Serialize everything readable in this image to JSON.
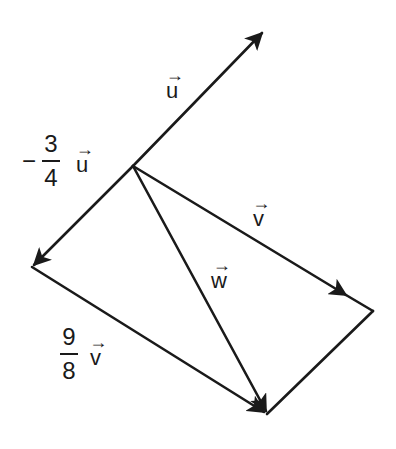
{
  "diagram": {
    "stroke_color": "#1a1a1a",
    "background": "#ffffff",
    "points": {
      "origin": [
        133,
        166
      ],
      "u_tip": [
        264,
        31
      ],
      "neg_three_quarter_u_tip": [
        32,
        267
      ],
      "v_end": [
        373,
        311
      ],
      "w_tip": [
        267,
        414
      ]
    },
    "vectors": [
      {
        "name": "u",
        "from": "origin",
        "to": "u_tip",
        "arrow": "end"
      },
      {
        "name": "-3/4 u",
        "from": "origin",
        "to": "neg_three_quarter_u_tip",
        "arrow": "end"
      },
      {
        "name": "v",
        "from": "origin",
        "to": "v_end",
        "arrow": "mid-end"
      },
      {
        "name": "w",
        "from": "origin",
        "to": "w_tip",
        "arrow": "end"
      },
      {
        "name": "9/8 v",
        "from": "neg_three_quarter_u_tip",
        "to": "w_tip",
        "arrow": "end"
      },
      {
        "name": "closing-segment",
        "from": "v_end",
        "to": "w_tip",
        "arrow": "none"
      }
    ]
  },
  "labels": {
    "u": {
      "letter": "u",
      "arrow": "→"
    },
    "neg_u": {
      "sign": "−",
      "numerator": "3",
      "denominator": "4",
      "letter": "u",
      "arrow": "→"
    },
    "v": {
      "letter": "v",
      "arrow": "→"
    },
    "w": {
      "letter": "w",
      "arrow": "→"
    },
    "scaled_v": {
      "numerator": "9",
      "denominator": "8",
      "letter": "v",
      "arrow": "→"
    }
  }
}
